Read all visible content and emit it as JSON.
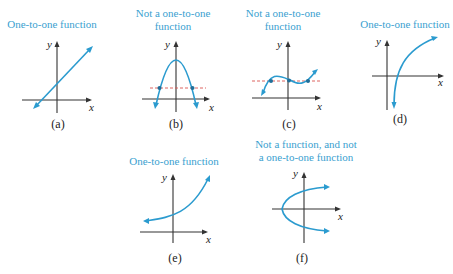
{
  "colors": {
    "title": "#3a9fd0",
    "curve": "#2b9bcf",
    "horizontal_line_test": "#d9534f",
    "axis": "#333333",
    "intersection_points": "#1f6f9a"
  },
  "axis_labels": {
    "x": "x",
    "y": "y"
  },
  "panels": [
    {
      "id": "a",
      "title": "One-to-one function",
      "caption": "(a)",
      "curve": "straight line with positive slope"
    },
    {
      "id": "b",
      "title": "Not a one-to-one function",
      "title_lines": [
        "Not a one-to-one",
        "function"
      ],
      "caption": "(b)",
      "curve": "downward parabola with horizontal dashed line crossing twice"
    },
    {
      "id": "c",
      "title": "Not a one-to-one function",
      "title_lines": [
        "Not a one-to-one",
        "function"
      ],
      "caption": "(c)",
      "curve": "cubic with horizontal dashed line crossing three times"
    },
    {
      "id": "d",
      "title": "One-to-one function",
      "caption": "(d)",
      "curve": "logarithmic curve"
    },
    {
      "id": "e",
      "title": "One-to-one function",
      "caption": "(e)",
      "curve": "exponential curve"
    },
    {
      "id": "f",
      "title": "Not a function, and not a one-to-one function",
      "title_lines": [
        "Not a function, and not",
        "a one-to-one function"
      ],
      "caption": "(f)",
      "curve": "sideways parabola opening right"
    }
  ]
}
